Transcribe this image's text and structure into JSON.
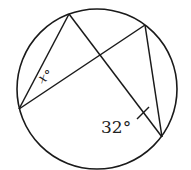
{
  "diagram": {
    "type": "circle-inscribed-angles",
    "circle": {
      "cx": 97,
      "cy": 89,
      "r": 80
    },
    "points": {
      "A": {
        "x": 69,
        "y": 14
      },
      "B": {
        "x": 19,
        "y": 109
      },
      "C": {
        "x": 145,
        "y": 25
      },
      "D": {
        "x": 162,
        "y": 137
      }
    },
    "segments": [
      {
        "from": "A",
        "to": "B"
      },
      {
        "from": "A",
        "to": "D"
      },
      {
        "from": "B",
        "to": "C"
      },
      {
        "from": "C",
        "to": "D"
      }
    ],
    "labels": {
      "angle_x": "x°",
      "angle_32": "32°"
    },
    "tick_mark": {
      "x1": 137,
      "y1": 119,
      "x2": 149,
      "y2": 107
    },
    "stroke_color": "#1a1a1a",
    "background": "#ffffff"
  }
}
